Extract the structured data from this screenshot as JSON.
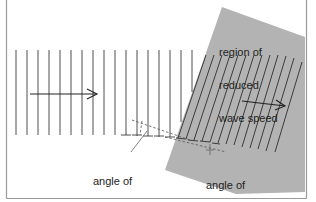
{
  "figure": {
    "type": "refraction diagram",
    "colors": {
      "background": "#ffffff",
      "frame": "#9a9a9a",
      "region_fill": "#b3b3b3",
      "line": "#333333",
      "dashed": "#555555"
    },
    "labels": {
      "region": [
        "region of",
        "reduced",
        "wave speed"
      ],
      "incidence": [
        "angle of",
        "incidence"
      ],
      "refraction": [
        "angle of",
        "refraction"
      ]
    },
    "arrows": {
      "incident_direction": "right",
      "refracted_direction": "right, slightly downward"
    }
  }
}
